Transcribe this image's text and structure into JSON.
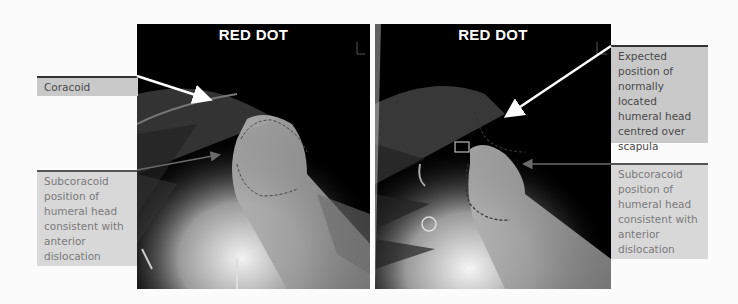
{
  "panels": [
    {
      "title": "RED DOT",
      "side": "left"
    },
    {
      "title": "RED DOT",
      "side": "right"
    }
  ],
  "labels": {
    "coracoid": "Coracoid",
    "left_subcoracoid": "Subcoracoid position of humeral head consistent with anterior dislocation",
    "expected_position": "Expected position of normally located humeral head centred over scapula",
    "right_subcoracoid": "Subcoracoid position of humeral head consistent with anterior dislocation"
  },
  "colors": {
    "label_bg": "#c9c9c9",
    "label_bg_light": "#d8d8d8",
    "arrow": "#ffffff",
    "pointer_line": "#6a6a6a"
  }
}
